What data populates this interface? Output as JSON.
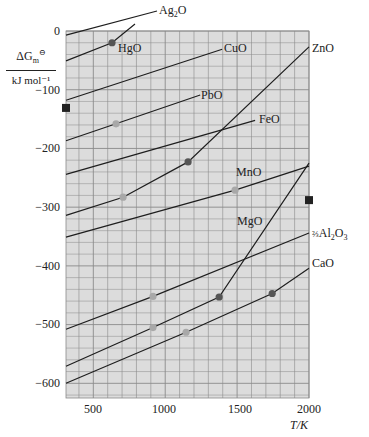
{
  "chart_data": {
    "type": "line",
    "title": "",
    "xlabel": "T/K",
    "ylabel": "ΔG°m / kJ mol⁻¹",
    "ylabel_top": "ΔG⊖m",
    "ylabel_bottom": "kJ mol⁻¹",
    "xlim": [
      310,
      2000
    ],
    "ylim": [
      -625,
      0
    ],
    "grid": true,
    "legend": "inline labels",
    "x_ticks": [
      500,
      1000,
      1500,
      2000
    ],
    "x_tick_labels": [
      "500",
      "1000",
      "1500",
      "2000"
    ],
    "y_ticks": [
      0,
      -100,
      -200,
      -300,
      -400,
      -500,
      -600
    ],
    "y_tick_labels": [
      "0",
      "−100",
      "−200",
      "−300",
      "−400",
      "−500",
      "−600"
    ],
    "series": [
      {
        "name": "Ag2O",
        "label": "Ag₂O",
        "points": [
          [
            310,
            -7
          ],
          [
            943,
            34
          ]
        ],
        "markers": []
      },
      {
        "name": "HgO",
        "label": "HgO",
        "points": [
          [
            310,
            -51
          ],
          [
            630,
            -20
          ],
          [
            790,
            12
          ]
        ],
        "markers": [
          {
            "T": 630,
            "G": -20,
            "color": "#555555"
          }
        ]
      },
      {
        "name": "CuO",
        "label": "CuO",
        "points": [
          [
            310,
            -118
          ],
          [
            1396,
            -31
          ]
        ],
        "markers": []
      },
      {
        "name": "PbO",
        "label": "PbO",
        "points": [
          [
            310,
            -187
          ],
          [
            658,
            -158
          ],
          [
            1243,
            -109
          ]
        ],
        "markers": [
          {
            "T": 658,
            "G": -158,
            "color": "#a8a8a8"
          }
        ]
      },
      {
        "name": "FeO",
        "label": "FeO",
        "points": [
          [
            310,
            -244
          ],
          [
            1625,
            -152
          ]
        ],
        "markers": []
      },
      {
        "name": "ZnO",
        "label": "ZnO",
        "points": [
          [
            310,
            -314
          ],
          [
            707,
            -283
          ],
          [
            1159,
            -223
          ],
          [
            2000,
            -27
          ]
        ],
        "markers": [
          {
            "T": 707,
            "G": -283,
            "color": "#a8a8a8"
          },
          {
            "T": 1159,
            "G": -223,
            "color": "#555555"
          }
        ]
      },
      {
        "name": "MnO",
        "label": "MnO",
        "points": [
          [
            310,
            -351
          ],
          [
            1486,
            -271
          ],
          [
            2000,
            -230
          ]
        ],
        "markers": [
          {
            "T": 1486,
            "G": -271,
            "color": "#a8a8a8"
          }
        ]
      },
      {
        "name": "MgO",
        "label": "MgO",
        "points": [
          [
            310,
            -571
          ],
          [
            915,
            -505
          ],
          [
            1375,
            -453
          ],
          [
            2000,
            -225
          ]
        ],
        "markers": [
          {
            "T": 915,
            "G": -505,
            "color": "#a8a8a8"
          },
          {
            "T": 1375,
            "G": -453,
            "color": "#555555"
          }
        ]
      },
      {
        "name": "Al2O3",
        "label": "⅔Al₂O₃",
        "points": [
          [
            310,
            -508
          ],
          [
            915,
            -452
          ],
          [
            2000,
            -344
          ]
        ],
        "markers": [
          {
            "T": 915,
            "G": -452,
            "color": "#a8a8a8"
          }
        ]
      },
      {
        "name": "CaO",
        "label": "CaO",
        "points": [
          [
            310,
            -600
          ],
          [
            1145,
            -513
          ],
          [
            1744,
            -447
          ],
          [
            2000,
            -404
          ]
        ],
        "markers": [
          {
            "T": 1145,
            "G": -513,
            "color": "#a8a8a8"
          },
          {
            "T": 1744,
            "G": -447,
            "color": "#555555"
          }
        ]
      }
    ],
    "edge_markers": [
      {
        "side": "left",
        "G": -131
      },
      {
        "side": "right",
        "G": -288
      }
    ]
  },
  "labels": {
    "ylabel_top": "ΔG",
    "ylabel_sub": "m",
    "ylabel_sup": "⊖",
    "ylabel_bottom": "kJ mol⁻¹",
    "xlabel": "T/K",
    "ag2o": "Ag",
    "ag2o_sub": "2",
    "ag2o_tail": "O",
    "hgo": "HgO",
    "cuo": "CuO",
    "pbo": "PbO",
    "feo": "FeO",
    "zno": "ZnO",
    "mno": "MnO",
    "mgo": "MgO",
    "al2o3_frac": "⅔",
    "al2o3_a": "Al",
    "al2o3_s1": "2",
    "al2o3_b": "O",
    "al2o3_s2": "3",
    "cao": "CaO"
  },
  "yticks": [
    "0",
    "−100",
    "−200",
    "−300",
    "−400",
    "−500",
    "−600"
  ],
  "xticks": [
    "500",
    "1000",
    "1500",
    "2000"
  ],
  "colors": {
    "plot_bg": "#dcdcdc",
    "grid": "#8a8a8a",
    "line": "#1e1e1e",
    "marker_dark": "#555555",
    "marker_light": "#a8a8a8",
    "edge_marker": "#222222"
  }
}
